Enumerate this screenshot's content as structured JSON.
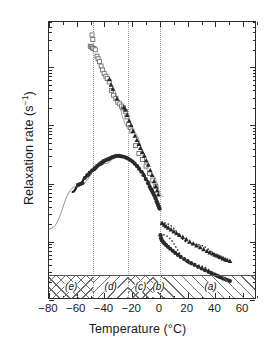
{
  "chart_data": {
    "type": "scatter",
    "title": "",
    "xlabel": "Temperature (°C)",
    "ylabel": "Relaxation rate (s⁻¹)",
    "xlim": [
      -80,
      70
    ],
    "ylim": [
      0.1,
      6000
    ],
    "yscale": "log",
    "xscale": "linear",
    "grid": "vertical dotted gridlines at -48, -23, 0",
    "legend": "none",
    "xticks": [
      -80,
      -60,
      -40,
      -20,
      0,
      20,
      40,
      60
    ],
    "xticklabels": [
      "−80",
      "−60",
      "−40",
      "−20",
      "0",
      "20",
      "40",
      "60"
    ],
    "yticks": [
      0.1,
      1,
      10,
      100,
      1000
    ],
    "yticklabels": [
      "10⁻¹",
      "10⁰",
      "10¹",
      "10²",
      "10³"
    ],
    "gridlines_x": [
      -48,
      -23,
      0
    ],
    "regions": [
      {
        "label": "(e)",
        "xmin": -80,
        "xmax": -48,
        "hatch": "cross"
      },
      {
        "label": "(d)",
        "xmin": -48,
        "xmax": -23,
        "hatch": "bwd"
      },
      {
        "label": "(c)",
        "xmin": -23,
        "xmax": -5,
        "hatch": "cross"
      },
      {
        "label": "(b)",
        "xmin": -5,
        "xmax": 3,
        "hatch": "fwd"
      },
      {
        "label": "(a)",
        "xmin": 3,
        "xmax": 70,
        "hatch": "fwd"
      }
    ],
    "series": [
      {
        "name": "open-squares-upper-branch",
        "marker": "open-square",
        "color": "#6f6f6f",
        "points": [
          [
            -49.0,
            3600
          ],
          [
            -48.4,
            3000
          ],
          [
            -50.2,
            2300
          ],
          [
            -49.4,
            2250
          ],
          [
            -48.6,
            2150
          ],
          [
            -47.6,
            2100
          ],
          [
            -46.6,
            2000
          ],
          [
            -45.4,
            1550
          ],
          [
            -44.6,
            1400
          ],
          [
            -43.6,
            1250
          ],
          [
            -42.4,
            1050
          ],
          [
            -41.4,
            900
          ],
          [
            -40.2,
            780
          ],
          [
            -39.0,
            700
          ],
          [
            -38.0,
            640
          ],
          [
            -36.6,
            560
          ],
          [
            -35.0,
            400
          ],
          [
            -33.4,
            330
          ],
          [
            -31.8,
            290
          ],
          [
            -30.4,
            250
          ],
          [
            -29.0,
            235
          ],
          [
            -27.6,
            215
          ],
          [
            -26.2,
            200
          ],
          [
            -25.0,
            175
          ],
          [
            -23.8,
            140
          ],
          [
            -22.6,
            105
          ],
          [
            -21.4,
            92
          ],
          [
            -20.2,
            80
          ],
          [
            -17.6,
            45
          ],
          [
            -15.2,
            33
          ],
          [
            -12.6,
            26
          ],
          [
            -10.0,
            20
          ],
          [
            -7.6,
            15
          ],
          [
            -5.2,
            11.5
          ],
          [
            -3.0,
            9.0
          ]
        ]
      },
      {
        "name": "filled-triangles-upper-branch",
        "marker": "filled-triangle",
        "color": "#262626",
        "points": [
          [
            -36.4,
            620
          ],
          [
            -35.2,
            500
          ],
          [
            -34.0,
            420
          ],
          [
            -31.0,
            290
          ],
          [
            -26.0,
            205
          ],
          [
            -24.8,
            185
          ],
          [
            -23.6,
            150
          ],
          [
            -22.2,
            120
          ],
          [
            -20.8,
            100
          ],
          [
            -19.4,
            80
          ],
          [
            -18.0,
            66
          ],
          [
            -16.6,
            56
          ],
          [
            -15.2,
            48
          ],
          [
            -14.0,
            41
          ],
          [
            -12.6,
            35
          ],
          [
            -11.2,
            30
          ],
          [
            -9.8,
            25
          ],
          [
            -8.4,
            21
          ],
          [
            -7.0,
            17
          ],
          [
            -5.6,
            14
          ],
          [
            -4.2,
            11
          ],
          [
            -3.0,
            9.0
          ],
          [
            -2.0,
            7.6
          ],
          [
            -1.2,
            6.5
          ]
        ]
      },
      {
        "name": "filled-circles-peak-branch",
        "marker": "filled-circle",
        "color": "#2a2a2a",
        "points": [
          [
            -59.0,
            9.5
          ],
          [
            -57.6,
            9.8
          ],
          [
            -56.0,
            10.2
          ],
          [
            -54.2,
            12.5
          ],
          [
            -52.4,
            14.0
          ],
          [
            -50.6,
            15.5
          ],
          [
            -48.8,
            17.0
          ],
          [
            -47.0,
            18.5
          ],
          [
            -45.4,
            20.0
          ],
          [
            -43.8,
            21.5
          ],
          [
            -42.2,
            23.0
          ],
          [
            -40.6,
            24.5
          ],
          [
            -39.0,
            25.5
          ],
          [
            -37.4,
            26.5
          ],
          [
            -35.8,
            27.5
          ],
          [
            -34.2,
            28.5
          ],
          [
            -32.6,
            29.5
          ],
          [
            -31.0,
            30.0
          ],
          [
            -29.4,
            30.0
          ],
          [
            -27.8,
            29.5
          ],
          [
            -26.2,
            29.0
          ],
          [
            -24.6,
            28.0
          ],
          [
            -23.0,
            27.0
          ],
          [
            -21.4,
            25.5
          ],
          [
            -19.8,
            24.0
          ],
          [
            -18.2,
            22.0
          ],
          [
            -16.6,
            20.0
          ],
          [
            -15.0,
            18.0
          ],
          [
            -13.4,
            16.0
          ],
          [
            -11.8,
            14.0
          ],
          [
            -10.2,
            12.0
          ],
          [
            -8.6,
            10.2
          ],
          [
            -7.4,
            8.8
          ],
          [
            -6.4,
            8.0
          ],
          [
            -5.6,
            7.4
          ],
          [
            -4.8,
            6.8
          ],
          [
            -4.0,
            6.2
          ],
          [
            -3.2,
            5.6
          ],
          [
            -2.4,
            5.0
          ],
          [
            -1.8,
            4.6
          ],
          [
            -1.2,
            4.2
          ],
          [
            -0.6,
            3.9
          ],
          [
            -0.2,
            3.7
          ]
        ]
      },
      {
        "name": "filled-triangles-lower-right",
        "marker": "filled-triangle",
        "color": "#262626",
        "points": [
          [
            1.6,
            2.1
          ],
          [
            3.0,
            1.95
          ],
          [
            4.4,
            1.85
          ],
          [
            6.0,
            1.74
          ],
          [
            8.0,
            1.62
          ],
          [
            10.0,
            1.5
          ],
          [
            12.0,
            1.4
          ],
          [
            14.0,
            1.3
          ],
          [
            16.5,
            1.2
          ],
          [
            19.0,
            1.1
          ],
          [
            21.5,
            1.0
          ],
          [
            24.0,
            0.93
          ],
          [
            26.5,
            0.86
          ],
          [
            29.0,
            0.8
          ],
          [
            31.5,
            0.745
          ],
          [
            34.0,
            0.695
          ],
          [
            36.0,
            0.655
          ],
          [
            38.0,
            0.625
          ],
          [
            39.5,
            0.6
          ],
          [
            41.0,
            0.58
          ],
          [
            42.5,
            0.56
          ],
          [
            44.0,
            0.54
          ],
          [
            45.5,
            0.52
          ],
          [
            47.0,
            0.5
          ],
          [
            48.5,
            0.485
          ],
          [
            50.5,
            0.465
          ]
        ]
      },
      {
        "name": "filled-circles-lower-right",
        "marker": "filled-circle",
        "color": "#2a2a2a",
        "points": [
          [
            0.4,
            1.3
          ],
          [
            0.8,
            1.15
          ],
          [
            1.4,
            1.05
          ],
          [
            2.2,
            1.0
          ],
          [
            3.2,
            0.94
          ],
          [
            4.4,
            0.88
          ],
          [
            5.8,
            0.82
          ],
          [
            7.4,
            0.76
          ],
          [
            9.2,
            0.7
          ],
          [
            11.0,
            0.645
          ],
          [
            13.0,
            0.595
          ],
          [
            15.0,
            0.55
          ],
          [
            17.5,
            0.505
          ],
          [
            20.0,
            0.465
          ],
          [
            22.5,
            0.43
          ],
          [
            25.0,
            0.4
          ],
          [
            27.5,
            0.372
          ],
          [
            30.0,
            0.348
          ],
          [
            32.5,
            0.326
          ],
          [
            35.0,
            0.305
          ],
          [
            37.0,
            0.29
          ],
          [
            39.0,
            0.277
          ],
          [
            40.5,
            0.266
          ],
          [
            42.0,
            0.257
          ],
          [
            43.5,
            0.248
          ],
          [
            45.0,
            0.239
          ],
          [
            46.5,
            0.231
          ],
          [
            48.0,
            0.223
          ],
          [
            49.5,
            0.216
          ],
          [
            50.5,
            0.212
          ]
        ]
      }
    ],
    "fits": [
      {
        "name": "thick-peak-fit-curve",
        "style": "solid-thick",
        "color": "#1b1b1b",
        "points": [
          [
            -63,
            7.2
          ],
          [
            -58,
            9.8
          ],
          [
            -53,
            13.2
          ],
          [
            -48,
            17.0
          ],
          [
            -43,
            21.0
          ],
          [
            -38,
            25.0
          ],
          [
            -33,
            28.6
          ],
          [
            -29,
            30.0
          ],
          [
            -25,
            28.6
          ],
          [
            -21,
            25.4
          ],
          [
            -17,
            21.0
          ],
          [
            -13,
            16.0
          ],
          [
            -9,
            11.2
          ],
          [
            -6,
            8.2
          ],
          [
            -3.5,
            6.0
          ],
          [
            -1.5,
            4.6
          ],
          [
            0,
            3.8
          ]
        ]
      },
      {
        "name": "thin-asymptote-line-left",
        "style": "solid-thin",
        "color": "#757575",
        "points": [
          [
            -80,
            1.65
          ],
          [
            -60,
            9.0
          ],
          [
            -40,
            22.0
          ],
          [
            -30,
            29.0
          ]
        ]
      },
      {
        "name": "thin-straight-line-through-upper-branch",
        "style": "solid-thin",
        "color": "#8a8a8a",
        "points": [
          [
            -38,
            560
          ],
          [
            -20,
            80
          ],
          [
            -5,
            13.5
          ],
          [
            2,
            6.0
          ]
        ]
      },
      {
        "name": "dotted-fit-lower-triangles",
        "style": "dotted",
        "color": "#2a2a2a",
        "points": [
          [
            1.0,
            2.15
          ],
          [
            25,
            0.9
          ],
          [
            51,
            0.455
          ]
        ]
      },
      {
        "name": "dashdot-fit-lower-circles",
        "style": "dash-dot",
        "color": "#2a2a2a",
        "points": [
          [
            0.2,
            1.35
          ],
          [
            25,
            0.4
          ],
          [
            51,
            0.21
          ]
        ]
      }
    ]
  },
  "axis": {
    "ylabel_main": "Relaxation rate (s",
    "ylabel_sup": "−1",
    "ylabel_close": ")",
    "xlabel": "Temperature (°C)"
  }
}
